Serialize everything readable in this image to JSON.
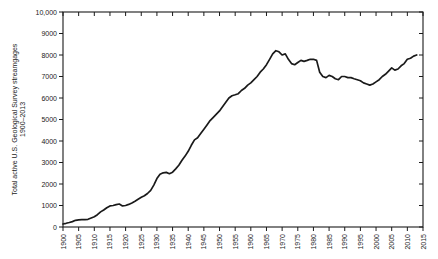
{
  "figure": {
    "background": "#ffffff",
    "line_color": "#1a1a1a",
    "axis_color": "#1a1a1a",
    "label_color": "#1a1a1a"
  },
  "chart_data": {
    "type": "line",
    "title": "",
    "xlabel": "",
    "ylabel": "Total active U.S. Geological Survey streamgages 1900–2013",
    "ylabel_lines": [
      "Total active U.S. Geological Survey streamgages",
      "1900–2013"
    ],
    "xlim": [
      1900,
      2015
    ],
    "ylim": [
      0,
      10000
    ],
    "grid": false,
    "legend": null,
    "x_ticks": [
      1900,
      1905,
      1910,
      1915,
      1920,
      1925,
      1930,
      1935,
      1940,
      1945,
      1950,
      1955,
      1960,
      1965,
      1970,
      1975,
      1980,
      1985,
      1990,
      1995,
      2000,
      2005,
      2010,
      2015
    ],
    "x_tick_labels": [
      "1900",
      "1905",
      "1910",
      "1915",
      "1920",
      "1925",
      "1930",
      "1935",
      "1940",
      "1945",
      "1950",
      "1955",
      "1960",
      "1965",
      "1970",
      "1975",
      "1980",
      "1985",
      "1990",
      "1995",
      "2000",
      "2005",
      "2010",
      "2015"
    ],
    "y_ticks": [
      0,
      1000,
      2000,
      3000,
      4000,
      5000,
      6000,
      7000,
      8000,
      9000,
      10000
    ],
    "y_tick_labels": [
      "0",
      "1000",
      "2000",
      "3000",
      "4000",
      "5000",
      "6000",
      "7000",
      "8000",
      "9000",
      "10,000"
    ],
    "x": [
      1900,
      1901,
      1902,
      1903,
      1904,
      1905,
      1906,
      1907,
      1908,
      1909,
      1910,
      1911,
      1912,
      1913,
      1914,
      1915,
      1916,
      1917,
      1918,
      1919,
      1920,
      1921,
      1922,
      1923,
      1924,
      1925,
      1926,
      1927,
      1928,
      1929,
      1930,
      1931,
      1932,
      1933,
      1934,
      1935,
      1936,
      1937,
      1938,
      1939,
      1940,
      1941,
      1942,
      1943,
      1944,
      1945,
      1946,
      1947,
      1948,
      1949,
      1950,
      1951,
      1952,
      1953,
      1954,
      1955,
      1956,
      1957,
      1958,
      1959,
      1960,
      1961,
      1962,
      1963,
      1964,
      1965,
      1966,
      1967,
      1968,
      1969,
      1970,
      1971,
      1972,
      1973,
      1974,
      1975,
      1976,
      1977,
      1978,
      1979,
      1980,
      1981,
      1982,
      1983,
      1984,
      1985,
      1986,
      1987,
      1988,
      1989,
      1990,
      1991,
      1992,
      1993,
      1994,
      1995,
      1996,
      1997,
      1998,
      1999,
      2000,
      2001,
      2002,
      2003,
      2004,
      2005,
      2006,
      2007,
      2008,
      2009,
      2010,
      2011,
      2012,
      2013
    ],
    "values": [
      140,
      170,
      210,
      250,
      310,
      330,
      340,
      345,
      360,
      420,
      480,
      570,
      700,
      790,
      900,
      980,
      1000,
      1040,
      1070,
      980,
      1000,
      1050,
      1120,
      1200,
      1290,
      1380,
      1450,
      1560,
      1700,
      1950,
      2250,
      2450,
      2520,
      2540,
      2480,
      2550,
      2700,
      2870,
      3100,
      3300,
      3520,
      3800,
      4050,
      4150,
      4350,
      4550,
      4750,
      4950,
      5100,
      5250,
      5400,
      5600,
      5800,
      6000,
      6100,
      6150,
      6200,
      6350,
      6450,
      6600,
      6700,
      6850,
      7000,
      7200,
      7350,
      7550,
      7800,
      8050,
      8200,
      8150,
      8000,
      8050,
      7800,
      7600,
      7550,
      7650,
      7750,
      7700,
      7750,
      7800,
      7800,
      7750,
      7200,
      7000,
      6950,
      7050,
      7000,
      6900,
      6850,
      7000,
      7000,
      6950,
      6950,
      6900,
      6850,
      6800,
      6700,
      6650,
      6600,
      6650,
      6750,
      6850,
      7000,
      7100,
      7250,
      7400,
      7300,
      7350,
      7500,
      7600,
      7800,
      7850,
      7950,
      8000
    ]
  }
}
